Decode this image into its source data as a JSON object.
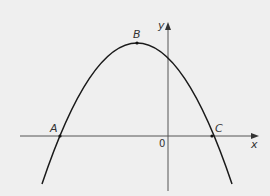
{
  "diagram": {
    "type": "parabola-on-axes",
    "axes": {
      "x_label": "x",
      "y_label": "y",
      "origin_label": "0"
    },
    "points": [
      {
        "id": "A",
        "label": "A",
        "role": "x-intercept (left)"
      },
      {
        "id": "B",
        "label": "B",
        "role": "maximum / vertex"
      },
      {
        "id": "C",
        "label": "C",
        "role": "x-intercept (right)"
      }
    ],
    "colors": {
      "background": "#efefef",
      "curve": "#1a1a1a",
      "axes": "#555555",
      "text": "#333333"
    }
  }
}
